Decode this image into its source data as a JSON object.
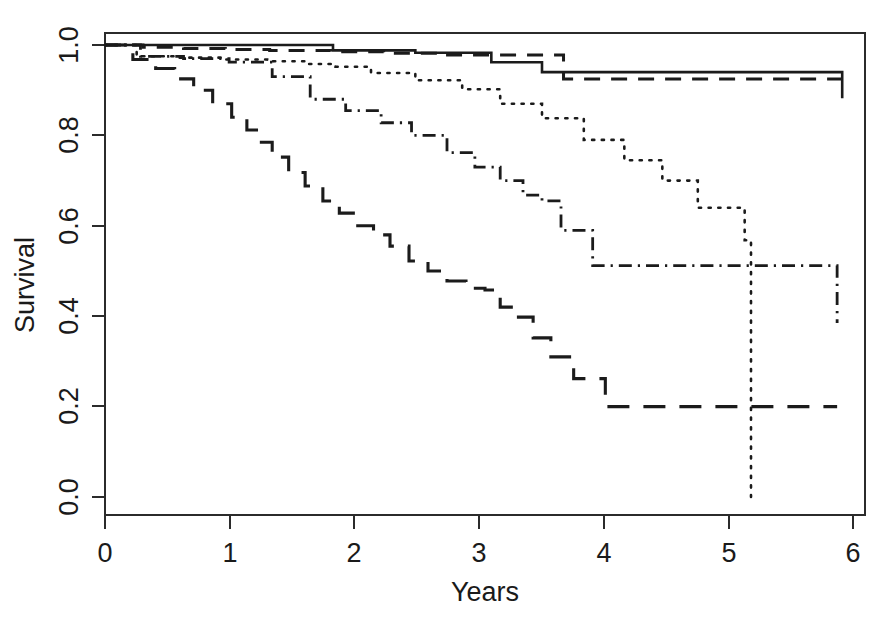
{
  "figure": {
    "title": "",
    "background": "#ffffff",
    "ink_color": "#1a1a1a"
  },
  "axes": {
    "x_title": "Years",
    "y_title": "Survival",
    "x_ticks": [
      "0",
      "1",
      "2",
      "3",
      "4",
      "5",
      "6"
    ],
    "y_ticks": [
      "0.0",
      "0.2",
      "0.4",
      "0.6",
      "0.8",
      "1.0"
    ]
  },
  "chart_data": {
    "type": "line",
    "title": "",
    "xlabel": "Years",
    "ylabel": "Survival",
    "xlim": [
      0,
      6
    ],
    "ylim": [
      0.0,
      1.0
    ],
    "grid": false,
    "legend": "none",
    "style": "kaplan-meier step curves",
    "x_ticks": [
      0,
      1,
      2,
      3,
      4,
      5,
      6
    ],
    "y_ticks": [
      0.0,
      0.2,
      0.4,
      0.6,
      0.8,
      1.0
    ],
    "series": [
      {
        "name": "Group 1",
        "linestyle": "solid",
        "step": "post",
        "x": [
          0.0,
          0.95,
          1.8,
          2.15,
          2.45,
          2.62,
          3.05,
          3.25,
          3.45,
          3.62,
          5.82
        ],
        "y": [
          1.0,
          1.0,
          0.988,
          0.988,
          0.983,
          0.983,
          0.962,
          0.962,
          0.94,
          0.94,
          0.882
        ],
        "final_value": 0.882
      },
      {
        "name": "Group 2",
        "linestyle": "dashed",
        "step": "post",
        "x": [
          0.0,
          0.3,
          0.62,
          0.95,
          1.3,
          1.78,
          2.2,
          2.62,
          3.62,
          5.82
        ],
        "y": [
          1.0,
          0.995,
          0.992,
          0.99,
          0.988,
          0.985,
          0.982,
          0.978,
          0.925,
          0.925
        ],
        "final_value": 0.925
      },
      {
        "name": "Group 3",
        "linestyle": "dotted",
        "step": "post",
        "x": [
          0.0,
          0.25,
          0.58,
          0.95,
          1.28,
          1.6,
          1.82,
          2.1,
          2.45,
          2.82,
          3.12,
          3.45,
          3.78,
          4.1,
          4.4,
          4.68,
          5.05,
          5.1,
          5.1
        ],
        "y": [
          1.0,
          0.975,
          0.972,
          0.968,
          0.964,
          0.958,
          0.952,
          0.938,
          0.922,
          0.902,
          0.87,
          0.838,
          0.79,
          0.745,
          0.7,
          0.64,
          0.568,
          0.568,
          0.0
        ],
        "final_value": 0.0,
        "note": "drops vertically to 0 at x = 5.10"
      },
      {
        "name": "Group 4",
        "linestyle": "dashdot",
        "step": "post",
        "x": [
          0.0,
          0.28,
          0.62,
          0.98,
          1.32,
          1.62,
          1.9,
          2.18,
          2.42,
          2.7,
          2.92,
          3.12,
          3.3,
          3.45,
          3.6,
          3.85,
          4.65,
          5.78
        ],
        "y": [
          1.0,
          0.975,
          0.97,
          0.962,
          0.93,
          0.88,
          0.855,
          0.828,
          0.8,
          0.762,
          0.73,
          0.7,
          0.668,
          0.655,
          0.59,
          0.512,
          0.512,
          0.385
        ],
        "final_value": 0.385
      },
      {
        "name": "Group 5",
        "linestyle": "longdash",
        "step": "post",
        "x": [
          0.0,
          0.22,
          0.4,
          0.55,
          0.7,
          0.85,
          1.0,
          1.12,
          1.22,
          1.32,
          1.45,
          1.58,
          1.72,
          1.85,
          1.98,
          2.12,
          2.25,
          2.4,
          2.55,
          2.7,
          2.85,
          3.0,
          3.12,
          3.25,
          3.38,
          3.52,
          3.7,
          3.95,
          5.78
        ],
        "y": [
          1.0,
          0.968,
          0.948,
          0.925,
          0.9,
          0.87,
          0.84,
          0.812,
          0.785,
          0.752,
          0.718,
          0.688,
          0.655,
          0.628,
          0.6,
          0.58,
          0.555,
          0.522,
          0.5,
          0.478,
          0.462,
          0.458,
          0.42,
          0.398,
          0.352,
          0.31,
          0.262,
          0.2,
          0.2
        ],
        "final_value": 0.2
      }
    ]
  }
}
